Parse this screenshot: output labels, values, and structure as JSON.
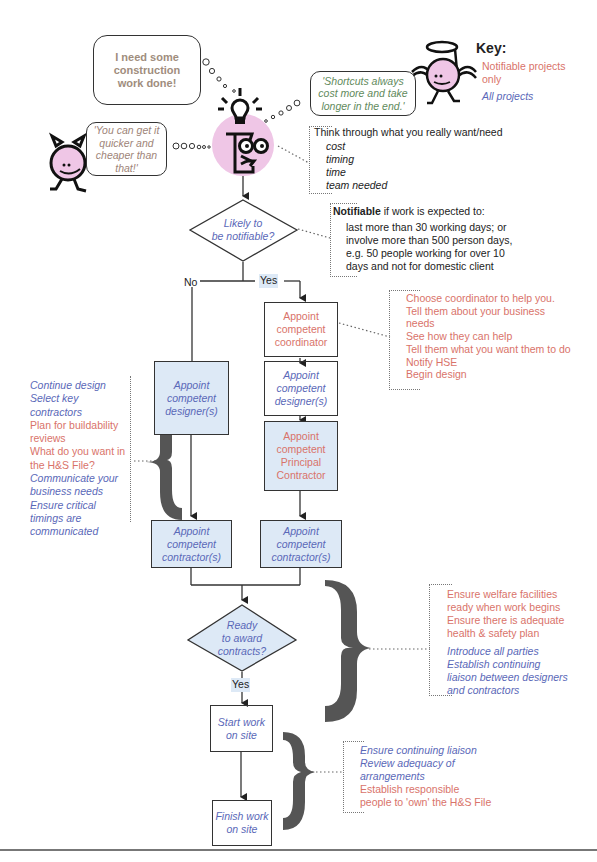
{
  "key": {
    "title": "Key:",
    "notifiable_label": "Notifiable projects only",
    "notifiable_line1": "Notifiable projects",
    "notifiable_line2": "only",
    "all_label": "All projects",
    "colors": {
      "notifiable": "#d9736a",
      "all": "#5a68b8"
    }
  },
  "bubbles": {
    "client": [
      "I need some",
      "construction",
      "work done!"
    ],
    "devil": [
      "'You can get it",
      "quicker and",
      "cheaper than",
      "that!'"
    ],
    "angel": [
      "'Shortcuts always",
      "cost more and take",
      "longer in the end.'"
    ]
  },
  "think_note": {
    "heading": "Think through what you really want/need",
    "items": [
      "cost",
      "timing",
      "time",
      "team needed"
    ]
  },
  "notifiable_note": {
    "bold": "Notifiable",
    "heading_rest": " if work is expected to:",
    "lines": [
      "last more than 30 working days; or",
      "involve more than 500 person days,",
      "e.g. 50 people working for over 10",
      "days and not for domestic client"
    ]
  },
  "flow": {
    "decision1": [
      "Likely to",
      "be notifiable?"
    ],
    "no_label": "No",
    "yes_label": "Yes",
    "coordinator": [
      "Appoint",
      "competent",
      "coordinator"
    ],
    "designer_left": [
      "Appoint",
      "competent",
      "designer(s)"
    ],
    "designer_right": [
      "Appoint",
      "competent",
      "designer(s)"
    ],
    "principal_contractor": [
      "Appoint",
      "competent",
      "Principal",
      "Contractor"
    ],
    "contractor_left": [
      "Appoint",
      "competent",
      "contractor(s)"
    ],
    "contractor_right": [
      "Appoint",
      "competent",
      "contractor(s)"
    ],
    "decision2": [
      "Ready",
      "to award",
      "contracts?"
    ],
    "yes2_label": "Yes",
    "start": [
      "Start work",
      "on site"
    ],
    "finish": [
      "Finish work",
      "on site"
    ]
  },
  "coordinator_note": [
    {
      "text": "Choose coordinator to help you.",
      "type": "notifiable"
    },
    {
      "text": "Tell them about your business",
      "type": "notifiable"
    },
    {
      "text": "needs",
      "type": "notifiable"
    },
    {
      "text": "See how they can help",
      "type": "notifiable"
    },
    {
      "text": "Tell them what you want them to do",
      "type": "notifiable"
    },
    {
      "text": "Notify HSE",
      "type": "notifiable"
    },
    {
      "text": "Begin design",
      "type": "notifiable"
    }
  ],
  "design_note": [
    {
      "text": "Continue design",
      "type": "all"
    },
    {
      "text": "Select key",
      "type": "all"
    },
    {
      "text": "contractors",
      "type": "all"
    },
    {
      "text": "Plan for buildability",
      "type": "notifiable"
    },
    {
      "text": "reviews",
      "type": "notifiable"
    },
    {
      "text": "What do you want in",
      "type": "notifiable"
    },
    {
      "text": "the H&S File?",
      "type": "notifiable"
    },
    {
      "text": "Communicate your",
      "type": "all"
    },
    {
      "text": "business needs",
      "type": "all"
    },
    {
      "text": "Ensure critical",
      "type": "all"
    },
    {
      "text": "timings are",
      "type": "all"
    },
    {
      "text": "communicated",
      "type": "all"
    }
  ],
  "contracts_note": [
    {
      "text": "Ensure welfare facilities",
      "type": "notifiable"
    },
    {
      "text": "ready when work begins",
      "type": "notifiable"
    },
    {
      "text": "Ensure there is adequate",
      "type": "notifiable"
    },
    {
      "text": "health & safety plan",
      "type": "notifiable"
    },
    {
      "text": "Introduce all parties",
      "type": "all"
    },
    {
      "text": "Establish continuing",
      "type": "all"
    },
    {
      "text": "liaison between designers",
      "type": "all"
    },
    {
      "text": "and contractors",
      "type": "all"
    }
  ],
  "site_note": [
    {
      "text": "Ensure continuing liaison",
      "type": "all"
    },
    {
      "text": "Review adequacy of",
      "type": "all"
    },
    {
      "text": "arrangements",
      "type": "all"
    },
    {
      "text": "Establish responsible",
      "type": "notifiable"
    },
    {
      "text": "people to 'own' the H&S File",
      "type": "notifiable"
    }
  ]
}
